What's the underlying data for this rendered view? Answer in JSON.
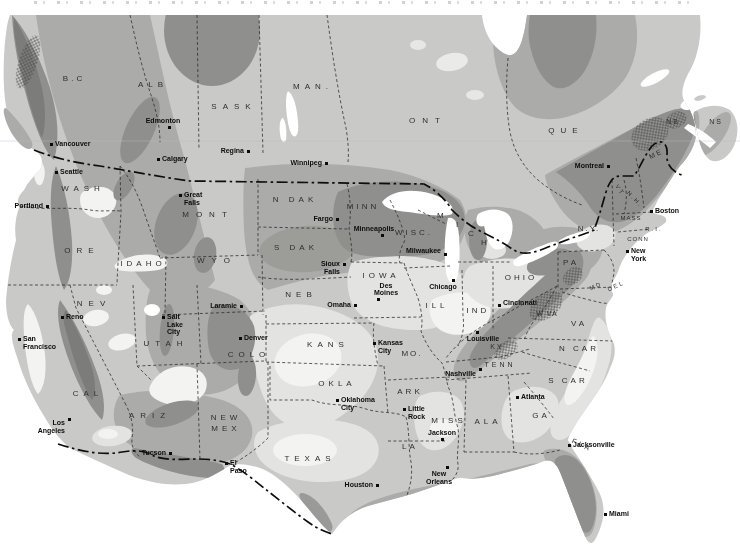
{
  "map": {
    "description": "Grayscale shaded relief/climate-zone style map of the United States and southern Canada with state and province borders, cropped caption at top edge",
    "palette": {
      "paper": "#ffffff",
      "land_light": "#c9c9c7",
      "zone_very_light": "#e3e3e1",
      "zone_white": "#f3f3f1",
      "zone_medium": "#ababa9",
      "zone_dark": "#8f8f8d",
      "zone_darkest": "#7c7c7a",
      "border_line": "#1f1f1f",
      "water": "#ffffff"
    },
    "regions": [
      {
        "label": "B.C",
        "x": 74,
        "y": 79,
        "ls": 3
      },
      {
        "label": "ALB",
        "x": 153,
        "y": 85,
        "ls": 5
      },
      {
        "label": "SASK",
        "x": 234,
        "y": 107,
        "ls": 6
      },
      {
        "label": "MAN.",
        "x": 313,
        "y": 87,
        "ls": 5
      },
      {
        "label": "ONT",
        "x": 428,
        "y": 121,
        "ls": 7
      },
      {
        "label": "QUE",
        "x": 566,
        "y": 131,
        "ls": 6
      },
      {
        "label": "NB",
        "x": 673,
        "y": 122,
        "ls": 2,
        "fs": 7
      },
      {
        "label": "NS",
        "x": 716,
        "y": 122,
        "ls": 2,
        "fs": 7
      },
      {
        "label": "ME",
        "x": 656,
        "y": 154,
        "ls": 2,
        "fs": 7,
        "rot": -25
      },
      {
        "label": "WASH",
        "x": 83,
        "y": 189,
        "ls": 5
      },
      {
        "label": "ORE",
        "x": 82,
        "y": 251,
        "ls": 6
      },
      {
        "label": "IDAHO",
        "x": 143,
        "y": 264,
        "ls": 4
      },
      {
        "label": "NEV",
        "x": 94,
        "y": 304,
        "ls": 6
      },
      {
        "label": "UTAH",
        "x": 166,
        "y": 344,
        "ls": 6
      },
      {
        "label": "CAL",
        "x": 88,
        "y": 394,
        "ls": 5
      },
      {
        "label": "ARIZ",
        "x": 150,
        "y": 416,
        "ls": 6
      },
      {
        "label": "NEW\nMEX",
        "x": 226,
        "y": 424,
        "ls": 4
      },
      {
        "label": "MONT",
        "x": 208,
        "y": 215,
        "ls": 7
      },
      {
        "label": "WYO",
        "x": 217,
        "y": 261,
        "ls": 7
      },
      {
        "label": "COLO",
        "x": 249,
        "y": 355,
        "ls": 5
      },
      {
        "label": "N DAK",
        "x": 295,
        "y": 200,
        "ls": 4
      },
      {
        "label": "S DAK",
        "x": 296,
        "y": 248,
        "ls": 4
      },
      {
        "label": "NEB",
        "x": 301,
        "y": 295,
        "ls": 5
      },
      {
        "label": "KANS",
        "x": 328,
        "y": 345,
        "ls": 5
      },
      {
        "label": "OKLA",
        "x": 337,
        "y": 384,
        "ls": 4
      },
      {
        "label": "TEXAS",
        "x": 310,
        "y": 459,
        "ls": 5
      },
      {
        "label": "MINN",
        "x": 363,
        "y": 207,
        "ls": 3
      },
      {
        "label": "IOWA",
        "x": 381,
        "y": 276,
        "ls": 4
      },
      {
        "label": "MO.",
        "x": 412,
        "y": 354,
        "ls": 2
      },
      {
        "label": "ARK",
        "x": 410,
        "y": 392,
        "ls": 3
      },
      {
        "label": "LA",
        "x": 410,
        "y": 447,
        "ls": 3
      },
      {
        "label": "WISC.",
        "x": 414,
        "y": 233,
        "ls": 3
      },
      {
        "label": "ILL",
        "x": 437,
        "y": 306,
        "ls": 4
      },
      {
        "label": "IND",
        "x": 478,
        "y": 311,
        "ls": 3
      },
      {
        "label": "OHIO",
        "x": 521,
        "y": 278,
        "ls": 3
      },
      {
        "label": "KY",
        "x": 497,
        "y": 347,
        "ls": 2,
        "fs": 7
      },
      {
        "label": "TENN",
        "x": 500,
        "y": 365,
        "ls": 3,
        "fs": 7
      },
      {
        "label": "MISS",
        "x": 449,
        "y": 421,
        "ls": 4
      },
      {
        "label": "ALA",
        "x": 488,
        "y": 422,
        "ls": 4
      },
      {
        "label": "GA",
        "x": 541,
        "y": 416,
        "ls": 3
      },
      {
        "label": "FLA",
        "x": 582,
        "y": 445,
        "ls": 3,
        "fs": 7,
        "rot": 25
      },
      {
        "label": "S CAR",
        "x": 568,
        "y": 381,
        "ls": 3
      },
      {
        "label": "N CAR",
        "x": 579,
        "y": 349,
        "ls": 3
      },
      {
        "label": "VA",
        "x": 579,
        "y": 324,
        "ls": 3
      },
      {
        "label": "W VA",
        "x": 547,
        "y": 314,
        "ls": 1,
        "fs": 7
      },
      {
        "label": "PA",
        "x": 571,
        "y": 263,
        "ls": 3
      },
      {
        "label": "N.Y.",
        "x": 589,
        "y": 229,
        "ls": 2
      },
      {
        "label": "MICH",
        "x": 437,
        "y": 211,
        "spread": [
          [
            0,
            0
          ],
          [
            19,
            9
          ],
          [
            31,
            18
          ],
          [
            44,
            27
          ]
        ]
      },
      {
        "label": "VT",
        "x": 620,
        "y": 190,
        "fs": 6,
        "rot": 55
      },
      {
        "label": "N.H.",
        "x": 635,
        "y": 199,
        "fs": 6,
        "rot": 45
      },
      {
        "label": "MASS",
        "x": 631,
        "y": 218,
        "fs": 6,
        "ls": 1
      },
      {
        "label": "R.I.",
        "x": 654,
        "y": 229,
        "fs": 6
      },
      {
        "label": "CONN",
        "x": 638,
        "y": 239,
        "fs": 6,
        "ls": 1
      },
      {
        "label": "MD",
        "x": 596,
        "y": 286,
        "fs": 6,
        "rot": -25
      },
      {
        "label": "DEL",
        "x": 616,
        "y": 286,
        "fs": 6,
        "rot": -25
      }
    ],
    "cities": [
      {
        "name": "Vancouver",
        "x": 51,
        "y": 144,
        "pos": "r"
      },
      {
        "name": "Seattle",
        "x": 56,
        "y": 172,
        "pos": "r"
      },
      {
        "name": "Portland",
        "x": 47,
        "y": 206,
        "pos": "l"
      },
      {
        "name": "Edmonton",
        "x": 169,
        "y": 127,
        "pos": "a",
        "dx": -6
      },
      {
        "name": "Calgary",
        "x": 158,
        "y": 159,
        "pos": "r"
      },
      {
        "name": "Regina",
        "x": 248,
        "y": 151,
        "pos": "l"
      },
      {
        "name": "Winnipeg",
        "x": 326,
        "y": 163,
        "pos": "l"
      },
      {
        "name": "Great Falls",
        "x": 180,
        "y": 195,
        "pos": "r"
      },
      {
        "name": "Fargo",
        "x": 337,
        "y": 219,
        "pos": "l"
      },
      {
        "name": "Minneapolis",
        "x": 382,
        "y": 235,
        "pos": "a",
        "dx": -8
      },
      {
        "name": "Milwaukee",
        "x": 445,
        "y": 254,
        "pos": "l",
        "dy": -3
      },
      {
        "name": "Sioux\nFalls",
        "x": 344,
        "y": 264,
        "pos": "l"
      },
      {
        "name": "Des Moines",
        "x": 378,
        "y": 299,
        "pos": "a",
        "dx": 8
      },
      {
        "name": "Omaha",
        "x": 355,
        "y": 305,
        "pos": "l"
      },
      {
        "name": "Chicago",
        "x": 453,
        "y": 280,
        "pos": "b",
        "dx": -10
      },
      {
        "name": "Kansas\nCity",
        "x": 374,
        "y": 343,
        "pos": "r"
      },
      {
        "name": "Laramie",
        "x": 241,
        "y": 306,
        "pos": "l"
      },
      {
        "name": "Denver",
        "x": 240,
        "y": 338,
        "pos": "r"
      },
      {
        "name": "Salt Lake\nCity",
        "x": 163,
        "y": 317,
        "pos": "r"
      },
      {
        "name": "Reno",
        "x": 62,
        "y": 317,
        "pos": "r"
      },
      {
        "name": "San\nFrancisco",
        "x": 19,
        "y": 339,
        "pos": "r"
      },
      {
        "name": "Los\nAngeles",
        "x": 69,
        "y": 419,
        "pos": "l",
        "dy": 4
      },
      {
        "name": "Tucson",
        "x": 170,
        "y": 453,
        "pos": "l"
      },
      {
        "name": "El Paso",
        "x": 226,
        "y": 463,
        "pos": "r"
      },
      {
        "name": "Oklahoma\nCity",
        "x": 337,
        "y": 400,
        "pos": "r"
      },
      {
        "name": "Little\nRock",
        "x": 404,
        "y": 409,
        "pos": "r"
      },
      {
        "name": "Jackson",
        "x": 442,
        "y": 439,
        "pos": "a"
      },
      {
        "name": "New\nOrleans",
        "x": 447,
        "y": 467,
        "pos": "b",
        "dx": -8
      },
      {
        "name": "Houston",
        "x": 377,
        "y": 485,
        "pos": "l"
      },
      {
        "name": "Nashville",
        "x": 480,
        "y": 369,
        "pos": "l",
        "dy": 5
      },
      {
        "name": "Louisville",
        "x": 477,
        "y": 332,
        "pos": "b",
        "dx": 6
      },
      {
        "name": "Cincinnati",
        "x": 499,
        "y": 305,
        "pos": "r",
        "dy": -2
      },
      {
        "name": "Atlanta",
        "x": 517,
        "y": 397,
        "pos": "r"
      },
      {
        "name": "Jacksonville",
        "x": 569,
        "y": 445,
        "pos": "r"
      },
      {
        "name": "Miami",
        "x": 605,
        "y": 514,
        "pos": "r"
      },
      {
        "name": "Montreal",
        "x": 608,
        "y": 166,
        "pos": "l"
      },
      {
        "name": "Boston",
        "x": 651,
        "y": 211,
        "pos": "r"
      },
      {
        "name": "New York",
        "x": 627,
        "y": 251,
        "pos": "r"
      }
    ]
  }
}
